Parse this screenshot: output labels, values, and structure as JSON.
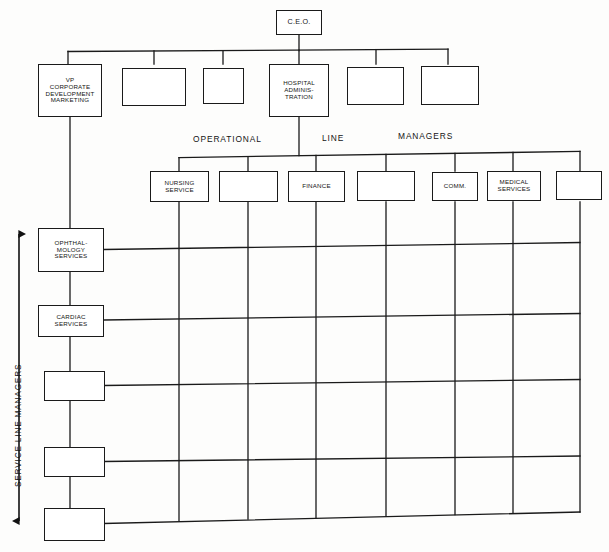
{
  "diagram": {
    "line_color": "#1a1a1a",
    "background": "#fdfdfc"
  },
  "band_labels": {
    "operational": "OPERATIONAL",
    "line": "LINE",
    "managers": "MANAGERS",
    "service_line_axis": "SERVICE LINE MANAGERS"
  },
  "executive": {
    "ceo": "C.E.O."
  },
  "vp_row": [
    {
      "id": "vp-corporate-development",
      "label": "VP\nCORPORATE\nDEVELOPMENT\nMARKETING"
    },
    {
      "id": "vp-blank-1",
      "label": ""
    },
    {
      "id": "vp-blank-2",
      "label": ""
    },
    {
      "id": "hospital-administration",
      "label": "HOSPITAL\nADMINIS-\nTRATION"
    },
    {
      "id": "vp-blank-3",
      "label": ""
    },
    {
      "id": "vp-blank-4",
      "label": ""
    }
  ],
  "operational_managers": [
    {
      "id": "nursing-service",
      "label": "NURSING\nSERVICE"
    },
    {
      "id": "op-blank-1",
      "label": ""
    },
    {
      "id": "finance",
      "label": "FINANCE"
    },
    {
      "id": "op-blank-2",
      "label": ""
    },
    {
      "id": "comm",
      "label": "COMM."
    },
    {
      "id": "medical-services",
      "label": "MEDICAL\nSERVICES"
    },
    {
      "id": "op-blank-3",
      "label": ""
    }
  ],
  "service_line_managers": [
    {
      "id": "ophthalmology-services",
      "label": "OPHTHAL-\nMOLOGY\nSERVICES"
    },
    {
      "id": "cardiac-services",
      "label": "CARDIAC\nSERVICES"
    },
    {
      "id": "slm-blank-1",
      "label": ""
    },
    {
      "id": "slm-blank-2",
      "label": ""
    },
    {
      "id": "slm-blank-3",
      "label": ""
    }
  ]
}
